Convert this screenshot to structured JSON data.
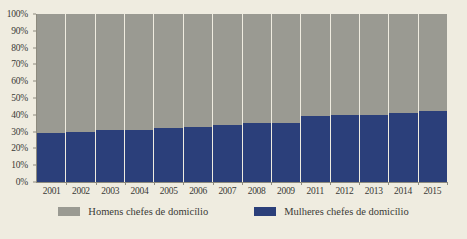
{
  "chart_data": {
    "type": "bar",
    "stacked": true,
    "title": "",
    "subtitle": "",
    "xlabel": "",
    "ylabel": "",
    "ylim": [
      0,
      100
    ],
    "grid": false,
    "legend_position": "bottom",
    "categories": [
      "2001",
      "2002",
      "2003",
      "2004",
      "2005",
      "2006",
      "2007",
      "2008",
      "2009",
      "2011",
      "2012",
      "2013",
      "2014",
      "2015"
    ],
    "y_ticks": [
      "0%",
      "10%",
      "20%",
      "30%",
      "40%",
      "50%",
      "60%",
      "70%",
      "80%",
      "90%",
      "100%"
    ],
    "y_tick_values": [
      0,
      10,
      20,
      30,
      40,
      50,
      60,
      70,
      80,
      90,
      100
    ],
    "series": [
      {
        "name": "Mulheres chefes de domicílio",
        "color": "#2b3f7a",
        "values": [
          29,
          30,
          31,
          31,
          32,
          33,
          34,
          35,
          35,
          39,
          40,
          40,
          41,
          42
        ]
      },
      {
        "name": "Homens chefes de domicílio",
        "color": "#9a9a92",
        "values": [
          71,
          70,
          69,
          69,
          68,
          67,
          66,
          65,
          65,
          61,
          60,
          60,
          59,
          58
        ]
      }
    ],
    "legend": [
      {
        "label": "Homens chefes de domicílio",
        "color": "#9a9a92"
      },
      {
        "label": "Mulheres chefes de domicílio",
        "color": "#2b3f7a"
      }
    ]
  },
  "colors": {
    "background": "#efece0",
    "men": "#9a9a92",
    "women": "#2b3f7a",
    "axis": "#8d8a7e",
    "text": "#3a3a36"
  }
}
